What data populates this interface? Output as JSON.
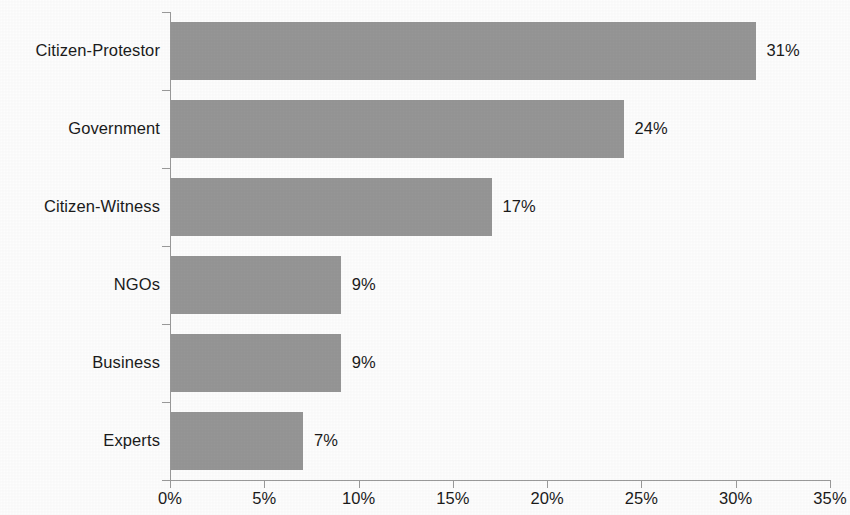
{
  "chart_data": {
    "type": "bar",
    "orientation": "horizontal",
    "title": "",
    "subtitle": "",
    "xlabel": "",
    "ylabel": "",
    "categories": [
      "Citizen-Protestor",
      "Government",
      "Citizen-Witness",
      "NGOs",
      "Business",
      "Experts"
    ],
    "values": [
      31,
      24,
      17,
      9,
      9,
      7
    ],
    "data_labels": [
      "31%",
      "24%",
      "17%",
      "9%",
      "9%",
      "7%"
    ],
    "xlim": [
      0,
      35
    ],
    "xticks": [
      0,
      5,
      10,
      15,
      20,
      25,
      30,
      35
    ],
    "xtick_labels": [
      "0%",
      "5%",
      "10%",
      "15%",
      "20%",
      "25%",
      "30%",
      "35%"
    ],
    "grid": false,
    "legend": false,
    "bar_color": "#969696",
    "axis_color": "#9a9a9a",
    "text_color": "#1b1b1b",
    "background_color": "#fdfdfd"
  },
  "bars": [
    {
      "category": "Citizen-Protestor",
      "value": 31,
      "label": "31%"
    },
    {
      "category": "Government",
      "value": 24,
      "label": "24%"
    },
    {
      "category": "Citizen-Witness",
      "value": 17,
      "label": "17%"
    },
    {
      "category": "NGOs",
      "value": 9,
      "label": "9%"
    },
    {
      "category": "Business",
      "value": 9,
      "label": "9%"
    },
    {
      "category": "Experts",
      "value": 7,
      "label": "7%"
    }
  ],
  "xaxis": {
    "ticks": [
      {
        "value": 0,
        "label": "0%"
      },
      {
        "value": 5,
        "label": "5%"
      },
      {
        "value": 10,
        "label": "10%"
      },
      {
        "value": 15,
        "label": "15%"
      },
      {
        "value": 20,
        "label": "20%"
      },
      {
        "value": 25,
        "label": "25%"
      },
      {
        "value": 30,
        "label": "30%"
      },
      {
        "value": 35,
        "label": "35%"
      }
    ]
  }
}
